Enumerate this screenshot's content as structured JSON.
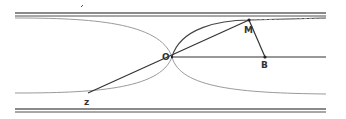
{
  "diagram": {
    "type": "geometry-figure",
    "colors": {
      "wall": "#8a8a8a",
      "curve": "#9a9a9a",
      "line": "#333333",
      "background": "#ffffff"
    },
    "points": [
      {
        "id": "O",
        "label": "O",
        "x": 172,
        "y": 57
      },
      {
        "id": "M",
        "label": "M",
        "x": 249,
        "y": 20
      },
      {
        "id": "B",
        "label": "B",
        "x": 265,
        "y": 57
      },
      {
        "id": "Z",
        "label": "z",
        "x": 88,
        "y": 93
      }
    ],
    "segments": [
      {
        "from": "Z",
        "to": "M"
      },
      {
        "from": "M",
        "to": "B"
      },
      {
        "from": "O",
        "to": "right-edge",
        "y": 57
      }
    ],
    "walls": {
      "top_y": [
        13,
        16
      ],
      "bottom_y": [
        109,
        112
      ],
      "x_start": 15,
      "x_end": 326
    }
  }
}
